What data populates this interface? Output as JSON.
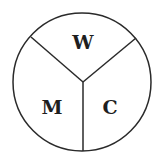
{
  "diagram": {
    "type": "three-sector circle",
    "stroke_color": "#2a2a2a",
    "background": "#ffffff",
    "sectors": [
      {
        "label": "W",
        "position": "top"
      },
      {
        "label": "M",
        "position": "bottom-left"
      },
      {
        "label": "C",
        "position": "bottom-right"
      }
    ]
  }
}
